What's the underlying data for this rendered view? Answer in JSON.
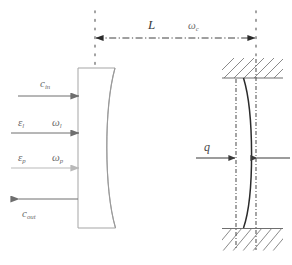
{
  "figure": {
    "type": "optomechanical-cavity-schematic",
    "background_color": "#ffffff",
    "width": 292,
    "height": 265,
    "labels": {
      "c_in": {
        "base": "c",
        "sub": "in"
      },
      "epsilon_l": {
        "base": "ε",
        "sub": "l"
      },
      "omega_l": {
        "base": "ω",
        "sub": "l"
      },
      "epsilon_p": {
        "base": "ε",
        "sub": "p"
      },
      "omega_p": {
        "base": "ω",
        "sub": "p"
      },
      "c_out": {
        "base": "c",
        "sub": "out"
      },
      "cavity_length": {
        "base": "L",
        "sub": ""
      },
      "omega_c": {
        "base": "ω",
        "sub": "c"
      },
      "displacement_q": {
        "base": "q",
        "sub": ""
      }
    },
    "colors": {
      "input_arrow_dark": "#6e6e6e",
      "input_arrow_light": "#b9b9b9",
      "mirror_outline": "#9a9a9a",
      "movable_mirror": "#2b2b2b",
      "hatch": "#7d7d7d",
      "dotted_guide": "#8a8a8a",
      "dashdot_guide": "#5a5a5a",
      "dimension_arrow": "#2b2b2b",
      "label_text": "#6a6a6a"
    },
    "elements": {
      "fixed_mirror": {
        "name": "curved-fixed-mirror",
        "x": 78,
        "y": 68,
        "width": 38,
        "height": 160,
        "curve": "concave-right"
      },
      "movable_mirror": {
        "name": "movable-membrane",
        "x_top": 243,
        "x_mid": 252,
        "x_bottom": 243,
        "y_top": 78,
        "y_bottom": 228
      },
      "hatch_block_top": {
        "x": 222,
        "y": 58,
        "width": 61,
        "height": 20
      },
      "hatch_block_bottom": {
        "x": 222,
        "y": 228,
        "width": 61,
        "height": 22
      },
      "guide_left_dotted": {
        "x": 95,
        "y_top": 12,
        "y_bottom": 68
      },
      "guide_right_dotted": {
        "x": 256,
        "y_top": 12,
        "y_bottom": 58
      },
      "dashdot_rest_position": {
        "x": 236,
        "y_top": 80,
        "y_bottom": 250
      },
      "dashdot_equilibrium": {
        "x": 256,
        "y_top": 60,
        "y_bottom": 250
      },
      "dimension_line": {
        "x_start": 95,
        "x_end": 256,
        "y": 38
      },
      "input_arrows": [
        {
          "name": "c-in-arrow",
          "x_start": 18,
          "x_end": 80,
          "y": 96,
          "direction": "right",
          "color": "#6e6e6e"
        },
        {
          "name": "epsilon-l-arrow",
          "x_start": 12,
          "x_end": 80,
          "y": 133,
          "direction": "right",
          "color": "#6e6e6e"
        },
        {
          "name": "epsilon-p-arrow",
          "x_start": 12,
          "x_end": 80,
          "y": 168,
          "direction": "right",
          "color": "#b9b9b9"
        },
        {
          "name": "c-out-arrow",
          "x_start": 78,
          "x_end": 18,
          "y": 199,
          "direction": "left",
          "color": "#6e6e6e"
        }
      ],
      "q_arrows": [
        {
          "name": "q-arrow-right",
          "x_start": 196,
          "x_end": 235,
          "y": 158,
          "direction": "right"
        },
        {
          "name": "q-arrow-left",
          "x_start": 289,
          "x_end": 257,
          "y": 158,
          "direction": "left"
        }
      ]
    }
  }
}
